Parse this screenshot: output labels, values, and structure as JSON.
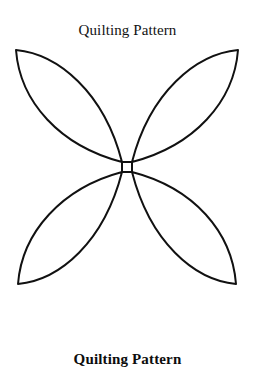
{
  "document": {
    "title": "Quilting Pattern",
    "background_color": "#ffffff",
    "ink_color": "#111111"
  },
  "header": {
    "title": "Quilting Pattern"
  },
  "figure": {
    "name": "four-petal-quilting-motif",
    "stroke_color": "#111111",
    "stroke_width": 2,
    "fill": "none",
    "petal_count": 4,
    "center": {
      "x": 127,
      "y": 125
    },
    "center_square_size": 10,
    "petals": [
      {
        "name": "petal-top-left",
        "tip_x": 16,
        "tip_y": 8
      },
      {
        "name": "petal-top-right",
        "tip_x": 238,
        "tip_y": 8
      },
      {
        "name": "petal-bottom-left",
        "tip_x": 18,
        "tip_y": 242
      },
      {
        "name": "petal-bottom-right",
        "tip_x": 236,
        "tip_y": 242
      }
    ]
  },
  "footer": {
    "caption": "Quilting Pattern"
  }
}
